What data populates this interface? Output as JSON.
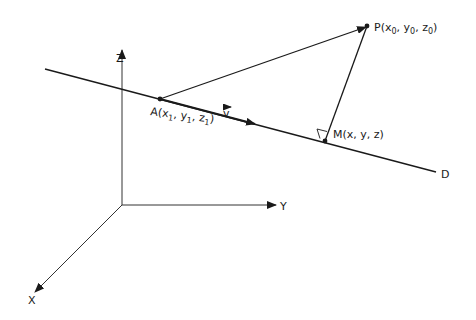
{
  "figure": {
    "axes": {
      "z_label": "Z",
      "y_label": "Y",
      "x_label": "X"
    },
    "line": {
      "label": "D"
    },
    "points": {
      "P": {
        "name": "P",
        "coords_text": "(x",
        "coords": [
          "x",
          "0",
          "y",
          "0",
          "z",
          "0"
        ]
      },
      "A": {
        "name": "A",
        "coords": [
          "x",
          "1",
          "y",
          "1",
          "z",
          "1"
        ]
      },
      "M": {
        "name": "M",
        "coords_text": "(x, y, z)"
      }
    },
    "vector": {
      "label": "v"
    },
    "colors": {
      "stroke": "#1a1a1a",
      "background": "#ffffff"
    }
  }
}
